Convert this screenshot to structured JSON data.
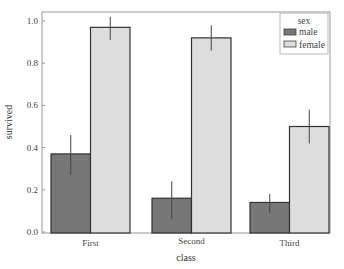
{
  "chart_data": {
    "type": "bar",
    "title": "",
    "xlabel": "class",
    "ylabel": "survived",
    "categories": [
      "First",
      "Second",
      "Third"
    ],
    "series": [
      {
        "name": "male",
        "color": "#777777",
        "values": [
          0.37,
          0.16,
          0.14
        ],
        "ci_low": [
          0.27,
          0.06,
          0.09
        ],
        "ci_high": [
          0.46,
          0.24,
          0.18
        ]
      },
      {
        "name": "female",
        "color": "#dddddd",
        "values": [
          0.97,
          0.92,
          0.5
        ],
        "ci_low": [
          0.91,
          0.86,
          0.42
        ],
        "ci_high": [
          1.02,
          0.98,
          0.58
        ]
      }
    ],
    "ylim": [
      0.0,
      1.05
    ],
    "yticks": [
      "0.0",
      "0.2",
      "0.4",
      "0.6",
      "0.8",
      "1.0"
    ],
    "grid": false,
    "legend": {
      "title": "sex",
      "position": "upper right",
      "entries": [
        "male",
        "female"
      ]
    }
  }
}
